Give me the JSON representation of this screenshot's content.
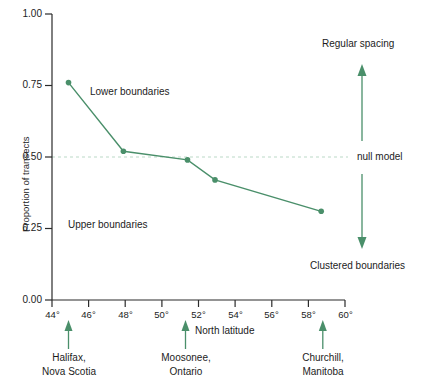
{
  "chart_data": {
    "type": "line",
    "title": "",
    "xlabel": "North latitude",
    "ylabel": "Proportion of transects",
    "xlim": [
      43,
      60.5
    ],
    "ylim": [
      0.0,
      1.0
    ],
    "grid": false,
    "legend_position": "none",
    "x": [
      44.9,
      47.9,
      51.4,
      52.9,
      58.7
    ],
    "values": [
      0.76,
      0.52,
      0.49,
      0.42,
      0.31
    ],
    "series": [
      {
        "name": "Proportion of transects",
        "x": [
          44.9,
          47.9,
          51.4,
          52.9,
          58.7
        ],
        "values": [
          0.76,
          0.52,
          0.49,
          0.42,
          0.31
        ],
        "color": "#4a8f6a",
        "marker": "circle"
      }
    ],
    "xticks": [
      44,
      46,
      48,
      50,
      52,
      54,
      56,
      58,
      60
    ],
    "xtick_labels": [
      "44°",
      "46°",
      "48°",
      "50°",
      "52°",
      "54°",
      "56°",
      "58°",
      "60°"
    ],
    "yticks": [
      0.0,
      0.25,
      0.5,
      0.75,
      1.0
    ],
    "ytick_labels": [
      "0.00",
      "0.25",
      "0.50",
      "0.75",
      "1.00"
    ],
    "reference_line": {
      "label": "null model",
      "y": 0.5,
      "style": "dashed",
      "color": "#bcd9c7"
    },
    "annotations": [
      {
        "name": "lower-boundaries",
        "text": "Lower boundaries",
        "x": 48.2,
        "y": 0.855
      },
      {
        "name": "upper-boundaries",
        "text": "Upper boundaries",
        "x": 46.6,
        "y": 0.25
      },
      {
        "name": "regular-spacing",
        "text": "Regular spacing",
        "x": 60.0,
        "y": 0.935
      },
      {
        "name": "clustered-boundaries",
        "text": "Clustered boundaries",
        "x": 60.0,
        "y": 0.105
      }
    ],
    "arrows": [
      {
        "name": "regular-spacing-arrow",
        "direction": "up",
        "x": 60.0,
        "y_from": 0.555,
        "y_to": 0.81,
        "color": "#4a8f6a"
      },
      {
        "name": "clustered-boundaries-arrow",
        "direction": "down",
        "x": 60.0,
        "y_from": 0.44,
        "y_to": 0.185,
        "color": "#4a8f6a"
      }
    ],
    "city_markers": [
      {
        "name": "halifax",
        "line1": "Halifax,",
        "line2": "Nova Scotia",
        "latitude": 44.9
      },
      {
        "name": "moosonee",
        "line1": "Moosonee,",
        "line2": "Ontario",
        "latitude": 51.3
      },
      {
        "name": "churchill",
        "line1": "Churchill,",
        "line2": "Manitoba",
        "latitude": 58.8
      }
    ],
    "colors": {
      "series": "#4a8f6a",
      "axis": "#2b2b2b",
      "reference_line": "#c3ddcb",
      "text": "#1c1c1c"
    }
  }
}
